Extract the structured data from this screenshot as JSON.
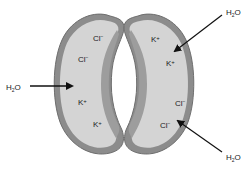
{
  "diagram": {
    "colors": {
      "cell_wall": "#8c8c8c",
      "wall_edge": "#6e6e6e",
      "cytoplasm": "#d4d4d4",
      "inner_wall": "#9a9a9a",
      "arrow": "#111111",
      "text": "#222222"
    },
    "left_cell": {
      "ions": [
        {
          "label": "Cl",
          "charge": "−"
        },
        {
          "label": "Cl",
          "charge": "−"
        },
        {
          "label": "K",
          "charge": "+"
        },
        {
          "label": "K",
          "charge": "+"
        }
      ]
    },
    "right_cell": {
      "ions": [
        {
          "label": "K",
          "charge": "+"
        },
        {
          "label": "K",
          "charge": "+"
        },
        {
          "label": "Cl",
          "charge": "−"
        },
        {
          "label": "Cl",
          "charge": "−"
        }
      ]
    },
    "water_labels": {
      "left": {
        "main": "H",
        "sub": "2",
        "end": "O"
      },
      "top_right": {
        "main": "H",
        "sub": "2",
        "end": "O"
      },
      "bottom_right": {
        "main": "H",
        "sub": "2",
        "end": "O"
      }
    }
  }
}
